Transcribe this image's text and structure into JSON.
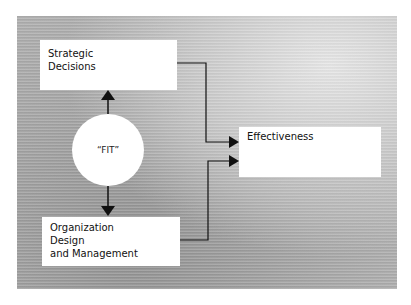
{
  "diagram": {
    "nodes": {
      "strategic": {
        "lines": [
          "Strategic",
          "Decisions"
        ]
      },
      "fit": {
        "label": "“FIT”"
      },
      "organization": {
        "lines": [
          "Organization",
          "Design",
          "and Management"
        ]
      },
      "effectiveness": {
        "label": "Effectiveness"
      }
    },
    "edges": [
      {
        "from": "fit",
        "to": "strategic",
        "type": "arrow"
      },
      {
        "from": "fit",
        "to": "organization",
        "type": "arrow"
      },
      {
        "from": "strategic",
        "to": "effectiveness",
        "type": "elbow-arrow"
      },
      {
        "from": "organization",
        "to": "effectiveness",
        "type": "elbow-arrow"
      }
    ],
    "colors": {
      "background_panel": "#ababab",
      "box": "#ffffff",
      "line": "#111111"
    }
  }
}
